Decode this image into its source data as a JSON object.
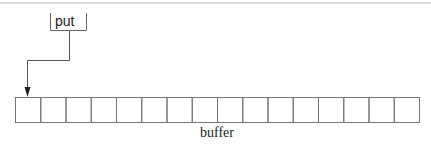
{
  "diagram": {
    "pointer": {
      "label": "put",
      "target_index": 0
    },
    "buffer": {
      "label": "buffer",
      "cell_count": 16
    },
    "colors": {
      "line": "#777777",
      "text": "#222222",
      "rule": "#aaaaaa"
    }
  }
}
